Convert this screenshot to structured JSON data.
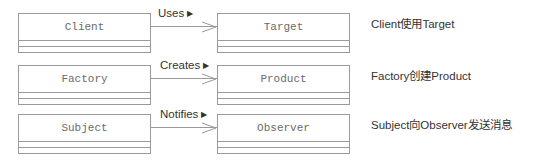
{
  "diagram": {
    "type": "uml-class-associations",
    "rows": [
      {
        "source": "Client",
        "target": "Target",
        "association": "Uses",
        "direction_glyph": "▶",
        "description": "Client使用Target"
      },
      {
        "source": "Factory",
        "target": "Product",
        "association": "Creates",
        "direction_glyph": "▶",
        "description": "Factory创建Product"
      },
      {
        "source": "Subject",
        "target": "Observer",
        "association": "Notifies",
        "direction_glyph": "▶",
        "description": "Subject向Observer发送消息"
      }
    ]
  },
  "colors": {
    "line": "#9a9a9a",
    "class_name_text": "#6a6a6a",
    "label_text": "#333333",
    "background": "#ffffff"
  }
}
